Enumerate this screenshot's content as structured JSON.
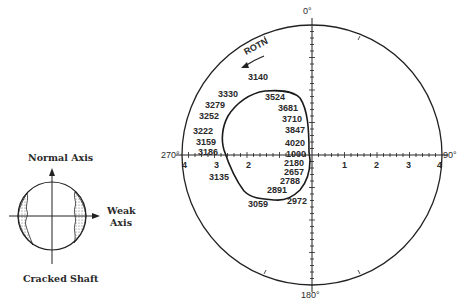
{
  "figure": {
    "top_caption_fragment": "",
    "left_diagram": {
      "title_top": "Normal Axis",
      "title_right_line1": "Weak",
      "title_right_line2": "Axis",
      "caption": "Cracked Shaft"
    },
    "polar_plot": {
      "angle_labels": {
        "top": "0°",
        "right": "90°",
        "bottom": "180°",
        "left": "270°"
      },
      "radial_ticks_left": [
        "4",
        "3",
        "2"
      ],
      "radial_ticks_right": [
        "1",
        "2",
        "3",
        "4"
      ],
      "rotation_label": "ROTN",
      "speed_labels": [
        {
          "text": "3140",
          "x": 248,
          "y": 80
        },
        {
          "text": "3330",
          "x": 218,
          "y": 97
        },
        {
          "text": "3524",
          "x": 265,
          "y": 100
        },
        {
          "text": "3279",
          "x": 205,
          "y": 108
        },
        {
          "text": "3681",
          "x": 278,
          "y": 111
        },
        {
          "text": "3252",
          "x": 199,
          "y": 119
        },
        {
          "text": "3710",
          "x": 282,
          "y": 122
        },
        {
          "text": "3847",
          "x": 285,
          "y": 133
        },
        {
          "text": "3222",
          "x": 193,
          "y": 134
        },
        {
          "text": "4020",
          "x": 285,
          "y": 146
        },
        {
          "text": "3159",
          "x": 196,
          "y": 145
        },
        {
          "text": "3186",
          "x": 198,
          "y": 155
        },
        {
          "text": "1000",
          "x": 286,
          "y": 157
        },
        {
          "text": "2180",
          "x": 284,
          "y": 166
        },
        {
          "text": "3135",
          "x": 209,
          "y": 180
        },
        {
          "text": "2657",
          "x": 284,
          "y": 175
        },
        {
          "text": "2788",
          "x": 280,
          "y": 184
        },
        {
          "text": "2891",
          "x": 267,
          "y": 193
        },
        {
          "text": "2972",
          "x": 287,
          "y": 204
        },
        {
          "text": "3059",
          "x": 248,
          "y": 207
        }
      ]
    }
  }
}
